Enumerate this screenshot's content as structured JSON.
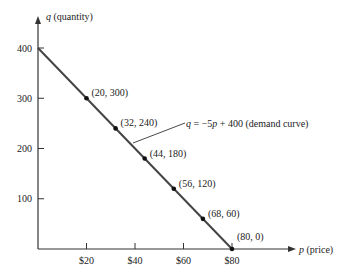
{
  "chart_data": {
    "type": "line",
    "title": "",
    "xlabel": "p (price)",
    "ylabel": "q (quantity)",
    "xlabel_var": "p",
    "xlabel_text": "(price)",
    "ylabel_var": "q",
    "ylabel_text": "(quantity)",
    "xlim": [
      0,
      80
    ],
    "ylim": [
      0,
      400
    ],
    "grid": false,
    "x_ticks": [
      20,
      40,
      60,
      80
    ],
    "x_tick_labels": [
      "$20",
      "$40",
      "$60",
      "$80"
    ],
    "y_ticks": [
      100,
      200,
      300,
      400
    ],
    "y_tick_labels": [
      "100",
      "200",
      "300",
      "400"
    ],
    "series": [
      {
        "name": "q = −5p + 400 (demand curve)",
        "x": [
          0,
          80
        ],
        "y": [
          400,
          0
        ]
      }
    ],
    "points": [
      {
        "x": 20,
        "y": 300,
        "label": "(20, 300)"
      },
      {
        "x": 32,
        "y": 240,
        "label": "(32, 240)"
      },
      {
        "x": 44,
        "y": 180,
        "label": "(44, 180)"
      },
      {
        "x": 56,
        "y": 120,
        "label": "(56, 120)"
      },
      {
        "x": 68,
        "y": 60,
        "label": "(68, 60)"
      },
      {
        "x": 80,
        "y": 0,
        "label": "(80, 0)"
      }
    ],
    "annotation": {
      "text": "q = −5p + 400 (demand curve)",
      "q_var": "q",
      "eq_rest": "= −5",
      "p_var": "p",
      "eq_tail": "+ 400 (demand curve)"
    }
  }
}
